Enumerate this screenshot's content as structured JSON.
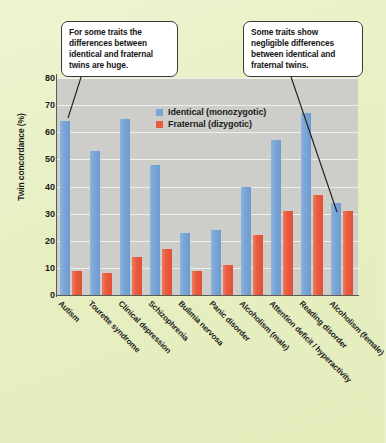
{
  "chart_data": {
    "type": "bar",
    "title": "",
    "xlabel": "",
    "ylabel": "Twin concordance (%)",
    "ylim": [
      0,
      80
    ],
    "yticks": [
      0,
      10,
      20,
      30,
      40,
      50,
      60,
      70,
      80
    ],
    "grid": true,
    "legend_position": "inside-top-center",
    "categories": [
      "Autism",
      "Tourette syndrome",
      "Clinical depression",
      "Schizophrenia",
      "Bulimia nervosa",
      "Panic disorder",
      "Alcoholism (male)",
      "Attention deficit / hyperactivity",
      "Reading disorder",
      "Alcoholism (female)"
    ],
    "series": [
      {
        "name": "Identical (monozygotic)",
        "color": "#7aa5d6",
        "values": [
          64,
          53,
          65,
          48,
          23,
          24,
          40,
          57,
          67,
          34
        ]
      },
      {
        "name": "Fraternal (dizygotic)",
        "color": "#e95c3e",
        "values": [
          9,
          8,
          14,
          17,
          9,
          11,
          22,
          31,
          37,
          31
        ]
      }
    ],
    "annotations": [
      {
        "id": "left",
        "text": "For some traits the differences between identical and fraternal twins are huge.",
        "points_to": "Autism"
      },
      {
        "id": "right",
        "text": "Some traits show negligible differences between identical and fraternal twins.",
        "points_to": "Alcoholism (female)"
      }
    ]
  },
  "colors": {
    "page_background": "#e9f0c6",
    "plot_background": "#cdcdc9",
    "gridline": "#f2f2ef",
    "axis": "#5c5c55",
    "identical": "#7aa5d6",
    "fraternal": "#e95c3e",
    "callout_border": "#3a3a3a",
    "callout_fill": "#ffffff"
  }
}
